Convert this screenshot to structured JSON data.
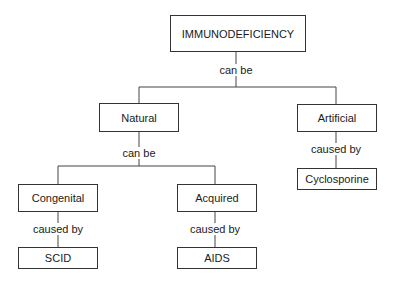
{
  "diagram": {
    "root": {
      "label": "IMMUNODEFICIENCY"
    },
    "root_relation": "can be",
    "natural": {
      "label": "Natural",
      "relation": "can be"
    },
    "artificial": {
      "label": "Artificial",
      "relation": "caused by"
    },
    "cyclosporine": {
      "label": "Cyclosporine"
    },
    "congenital": {
      "label": "Congenital",
      "relation": "caused by"
    },
    "acquired": {
      "label": "Acquired",
      "relation": "caused by"
    },
    "scid": {
      "label": "SCID"
    },
    "aids": {
      "label": "AIDS"
    }
  }
}
